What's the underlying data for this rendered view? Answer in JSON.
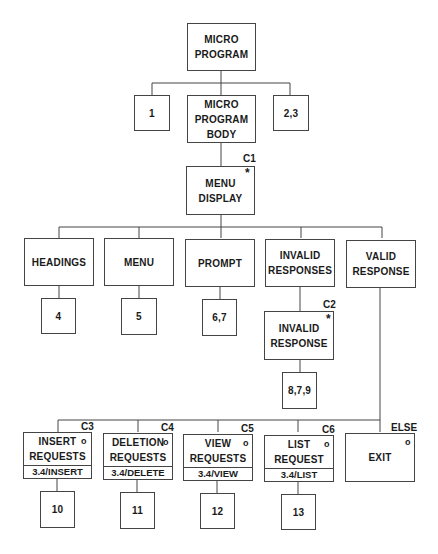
{
  "diagram": {
    "type": "jackson-structure-chart",
    "nodes": {
      "micro_program": {
        "label": "MICRO\nPROGRAM"
      },
      "ref_1": {
        "label": "1"
      },
      "micro_program_body": {
        "label": "MICRO\nPROGRAM\nBODY"
      },
      "ref_2_3": {
        "label": "2,3"
      },
      "menu_display": {
        "label": "MENU\nDISPLAY",
        "condition": "C1",
        "marker": "*"
      },
      "headings": {
        "label": "HEADINGS"
      },
      "menu": {
        "label": "MENU"
      },
      "prompt": {
        "label": "PROMPT"
      },
      "invalid_responses": {
        "label": "INVALID\nRESPONSES"
      },
      "valid_response": {
        "label": "VALID\nRESPONSE"
      },
      "ref_4": {
        "label": "4"
      },
      "ref_5": {
        "label": "5"
      },
      "ref_6_7": {
        "label": "6,7"
      },
      "invalid_response": {
        "label": "INVALID\nRESPONSE",
        "condition": "C2",
        "marker": "*"
      },
      "ref_8_7_9": {
        "label": "8,7,9"
      },
      "insert_requests": {
        "label": "INSERT\nREQUESTS",
        "footer": "3.4/INSERT",
        "condition": "C3",
        "marker": "o"
      },
      "deletion_requests": {
        "label": "DELETION\nREQUESTS",
        "footer": "3.4/DELETE",
        "condition": "C4",
        "marker": "o"
      },
      "view_requests": {
        "label": "VIEW\nREQUESTS",
        "footer": "3.4/VIEW",
        "condition": "C5",
        "marker": "o"
      },
      "list_request": {
        "label": "LIST\nREQUEST",
        "footer": "3.4/LIST",
        "condition": "C6",
        "marker": "o"
      },
      "exit": {
        "label": "EXIT",
        "condition": "ELSE",
        "marker": "o"
      },
      "ref_10": {
        "label": "10"
      },
      "ref_11": {
        "label": "11"
      },
      "ref_12": {
        "label": "12"
      },
      "ref_13": {
        "label": "13"
      }
    },
    "edges": [
      [
        "micro_program",
        "ref_1"
      ],
      [
        "micro_program",
        "micro_program_body"
      ],
      [
        "micro_program",
        "ref_2_3"
      ],
      [
        "micro_program_body",
        "menu_display"
      ],
      [
        "menu_display",
        "headings"
      ],
      [
        "menu_display",
        "menu"
      ],
      [
        "menu_display",
        "prompt"
      ],
      [
        "menu_display",
        "invalid_responses"
      ],
      [
        "menu_display",
        "valid_response"
      ],
      [
        "headings",
        "ref_4"
      ],
      [
        "menu",
        "ref_5"
      ],
      [
        "prompt",
        "ref_6_7"
      ],
      [
        "invalid_responses",
        "invalid_response"
      ],
      [
        "invalid_response",
        "ref_8_7_9"
      ],
      [
        "valid_response",
        "insert_requests"
      ],
      [
        "valid_response",
        "deletion_requests"
      ],
      [
        "valid_response",
        "view_requests"
      ],
      [
        "valid_response",
        "list_request"
      ],
      [
        "valid_response",
        "exit"
      ],
      [
        "insert_requests",
        "ref_10"
      ],
      [
        "deletion_requests",
        "ref_11"
      ],
      [
        "view_requests",
        "ref_12"
      ],
      [
        "list_request",
        "ref_13"
      ]
    ]
  }
}
